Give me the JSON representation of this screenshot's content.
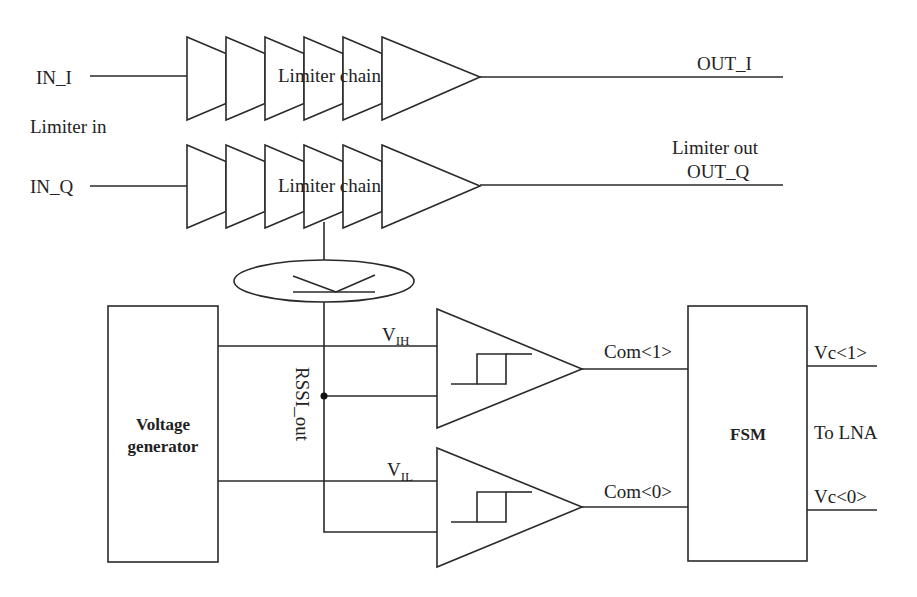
{
  "diagram": {
    "type": "block-diagram",
    "inputs": {
      "in_i": "IN_I",
      "in_q": "IN_Q",
      "group_label": "Limiter in"
    },
    "limiter_chains": [
      {
        "label": "Limiter chain",
        "input": "IN_I",
        "output": "OUT_I",
        "stages": 6
      },
      {
        "label": "Limiter chain",
        "input": "IN_Q",
        "output": "OUT_Q",
        "stages": 6
      }
    ],
    "outputs": {
      "out_i": "OUT_I",
      "out_q": "OUT_Q",
      "group_label": "Limiter out"
    },
    "rssi": {
      "signal_label": "RSSI_out",
      "detector_icon": "rssi-detector-icon"
    },
    "voltage_generator": {
      "line1": "Voltage",
      "line2": "generator",
      "vih_label_main": "V",
      "vih_label_sub": "IH",
      "vil_label_main": "V",
      "vil_label_sub": "IL"
    },
    "comparators": [
      {
        "name": "hysteresis-comparator-high",
        "output": "Com<1>",
        "icon": "hysteresis-icon"
      },
      {
        "name": "hysteresis-comparator-low",
        "output": "Com<0>",
        "icon": "hysteresis-icon"
      }
    ],
    "fsm": {
      "label": "FSM",
      "out1": "Vc<1>",
      "out0": "Vc<0>",
      "destination": "To LNA"
    }
  }
}
